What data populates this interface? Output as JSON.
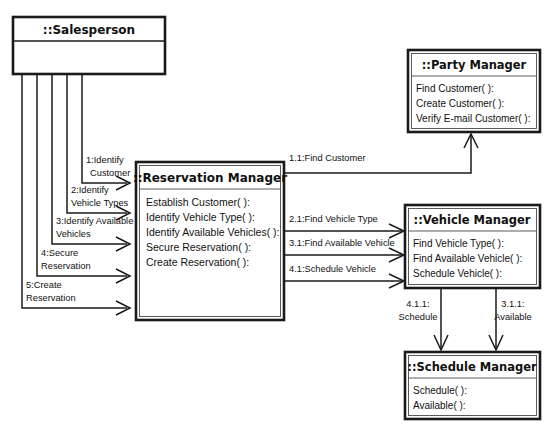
{
  "diagram": {
    "type": "uml-collaboration-diagram"
  },
  "classes": {
    "salesperson": {
      "name": "::Salesperson",
      "operations": []
    },
    "reservation_manager": {
      "name": "::Reservation Manager",
      "operations": [
        "Establish Customer( ):",
        "Identify Vehicle Type( ):",
        "Identify Available Vehicles( ):",
        "Secure Reservation( ):",
        "Create Reservation( ):"
      ]
    },
    "party_manager": {
      "name": "::Party Manager",
      "operations": [
        "Find Customer( ):",
        "Create Customer( ):",
        "Verify E-mail Customer( ):"
      ]
    },
    "vehicle_manager": {
      "name": "::Vehicle Manager",
      "operations": [
        "Find Vehicle Type( ):",
        "Find Available Vehicle( ):",
        "Schedule Vehicle( ):"
      ]
    },
    "schedule_manager": {
      "name": "::Schedule Manager",
      "operations": [
        "Schedule( ):",
        "Available( ):"
      ]
    }
  },
  "messages": {
    "salesperson_to_reservation": [
      {
        "id": "m1",
        "line1": "1:Identify",
        "line2": "Customer"
      },
      {
        "id": "m2",
        "line1": "2:Identify",
        "line2": "Vehicle Types"
      },
      {
        "id": "m3",
        "line1": "3:Identify Available",
        "line2": "Vehicles"
      },
      {
        "id": "m4",
        "line1": "4:Secure",
        "line2": "Reservation"
      },
      {
        "id": "m5",
        "line1": "5:Create",
        "line2": "Reservation"
      }
    ],
    "reservation_to_party": [
      {
        "id": "m11",
        "label": "1.1:Find Customer"
      }
    ],
    "reservation_to_vehicle": [
      {
        "id": "m21",
        "label": "2.1:Find Vehicle Type"
      },
      {
        "id": "m31",
        "label": "3.1:Find Available Vehicle"
      },
      {
        "id": "m41",
        "label": "4.1:Schedule Vehicle"
      }
    ],
    "vehicle_to_schedule": [
      {
        "id": "m411",
        "line1": "4.1.1:",
        "line2": "Schedule"
      },
      {
        "id": "m311",
        "line1": "3.1.1:",
        "line2": "Available"
      }
    ]
  },
  "colors": {
    "background": "#ffffff",
    "stroke": "#1a1a1a",
    "inner_stroke": "#4a4a4a",
    "text": "#111111"
  }
}
